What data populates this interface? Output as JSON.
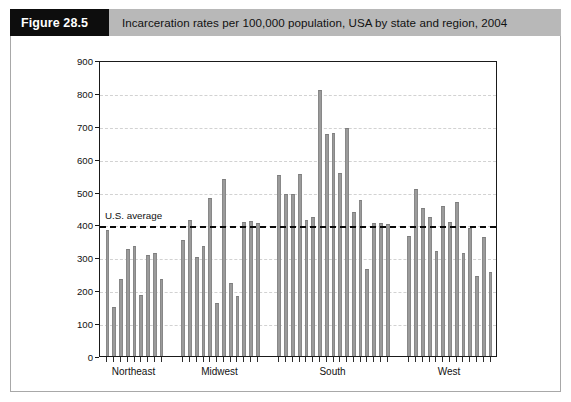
{
  "caption": {
    "tag": "Figure 28.5",
    "text": "Incarceration rates per 100,000 population, USA by state and region, 2004"
  },
  "annotation": {
    "us_average_label": "U.S. average",
    "us_average_value": 400
  },
  "colors": {
    "bar_fill": "#9b9b9b",
    "bar_edge": "#888888",
    "axis": "#1a1a1a",
    "grid": "#d2d2d2",
    "caption_tag_bg": "#0d0d0d",
    "caption_bar_bg": "#b8b8b8",
    "avg_line": "#0a0a0a"
  },
  "chart_data": {
    "type": "bar",
    "title": "Incarceration rates per 100,000 population, USA by state and region, 2004",
    "xlabel": "",
    "ylabel": "",
    "ylim": [
      0,
      900
    ],
    "yticks": [
      0,
      100,
      200,
      300,
      400,
      500,
      600,
      700,
      800,
      900
    ],
    "ytick_labels": [
      "0",
      "100",
      "200",
      "300",
      "400",
      "500",
      "600",
      "700",
      "800",
      "900"
    ],
    "grid": true,
    "legend": false,
    "group_labels": [
      "Northeast",
      "Midwest",
      "South",
      "West"
    ],
    "reference_line": {
      "label": "U.S. average",
      "value": 400,
      "style": "dashed"
    },
    "groups": [
      {
        "name": "Northeast",
        "values": [
          383,
          148,
          233,
          325,
          333,
          186,
          308,
          313,
          234
        ]
      },
      {
        "name": "Midwest",
        "values": [
          352,
          414,
          300,
          334,
          481,
          161,
          539,
          221,
          183,
          407,
          410,
          404
        ]
      },
      {
        "name": "South",
        "values": [
          551,
          492,
          492,
          553,
          414,
          424,
          810,
          676,
          677,
          557,
          694,
          437,
          474,
          265,
          403,
          404,
          400
        ]
      },
      {
        "name": "West",
        "values": [
          365,
          508,
          451,
          424,
          318,
          456,
          406,
          467,
          314,
          390,
          242,
          361,
          256
        ]
      }
    ]
  }
}
